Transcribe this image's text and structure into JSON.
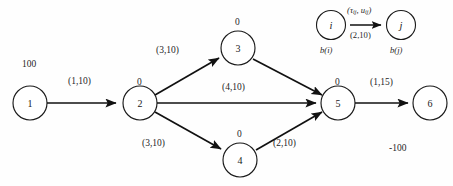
{
  "diagram": {
    "nodes": [
      {
        "id": "1",
        "label": "1",
        "cx": 30,
        "cy": 103,
        "r": 17,
        "balance": "100"
      },
      {
        "id": "2",
        "label": "2",
        "cx": 140,
        "cy": 103,
        "r": 17,
        "balance": "0"
      },
      {
        "id": "3",
        "label": "3",
        "cx": 238,
        "cy": 48,
        "r": 17,
        "balance": "0"
      },
      {
        "id": "4",
        "label": "4",
        "cx": 240,
        "cy": 160,
        "r": 17,
        "balance": "0"
      },
      {
        "id": "5",
        "label": "5",
        "cx": 338,
        "cy": 103,
        "r": 17,
        "balance": "0"
      },
      {
        "id": "6",
        "label": "6",
        "cx": 430,
        "cy": 103,
        "r": 17,
        "balance": "-100"
      }
    ],
    "arcs": [
      {
        "id": "a12",
        "from": "1",
        "to": "2",
        "label": "(1,10)"
      },
      {
        "id": "a23",
        "from": "2",
        "to": "3",
        "label": "(3,10)"
      },
      {
        "id": "a24",
        "from": "2",
        "to": "4",
        "label": "(3,10)"
      },
      {
        "id": "a25",
        "from": "2",
        "to": "5",
        "label": "(4,10)"
      },
      {
        "id": "a35",
        "from": "3",
        "to": "5",
        "label": ""
      },
      {
        "id": "a45",
        "from": "4",
        "to": "5",
        "label": "(2,10)"
      },
      {
        "id": "a56",
        "from": "5",
        "to": "6",
        "label": "(1,15)"
      }
    ],
    "balance_labels": {
      "node1": "100",
      "node2": "0",
      "node3": "0",
      "node4": "0",
      "node5": "0",
      "node6": "-100"
    },
    "arc_labels": {
      "arc_1_2": "(1,10)",
      "arc_2_3": "(3,10)",
      "arc_2_5": "(4,10)",
      "arc_2_4": "(3,10)",
      "arc_4_5": "(2,10)",
      "arc_5_6": "(1,15)"
    },
    "legend": {
      "node_i_label": "i",
      "node_j_label": "j",
      "node_i_balance": "b(i)",
      "node_j_balance": "b(j)",
      "arc_notation_cost": "τ",
      "arc_notation_cost_sub": "ij",
      "arc_notation_capacity": "u",
      "arc_notation_capacity_sub": "ij",
      "arc_notation_full": "(τij, uij)",
      "arc_example_values": "(2,10)"
    }
  }
}
